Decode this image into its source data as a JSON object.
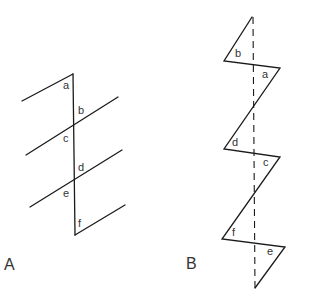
{
  "figures": [
    {
      "id": "A",
      "label": "A",
      "angle_labels": [
        "a",
        "b",
        "c",
        "d",
        "e",
        "f"
      ],
      "description": "A vertical transversal crossing four parallel oblique lines; angles a-f marked"
    },
    {
      "id": "B",
      "label": "B",
      "angle_labels": [
        "b",
        "a",
        "d",
        "c",
        "f",
        "e"
      ],
      "description": "Zigzag (folded) figure with a dashed vertical axis; angles a-f marked at the corners"
    }
  ],
  "colors": {
    "stroke": "#1a1a1a",
    "text": "#333333",
    "background": "#ffffff"
  }
}
